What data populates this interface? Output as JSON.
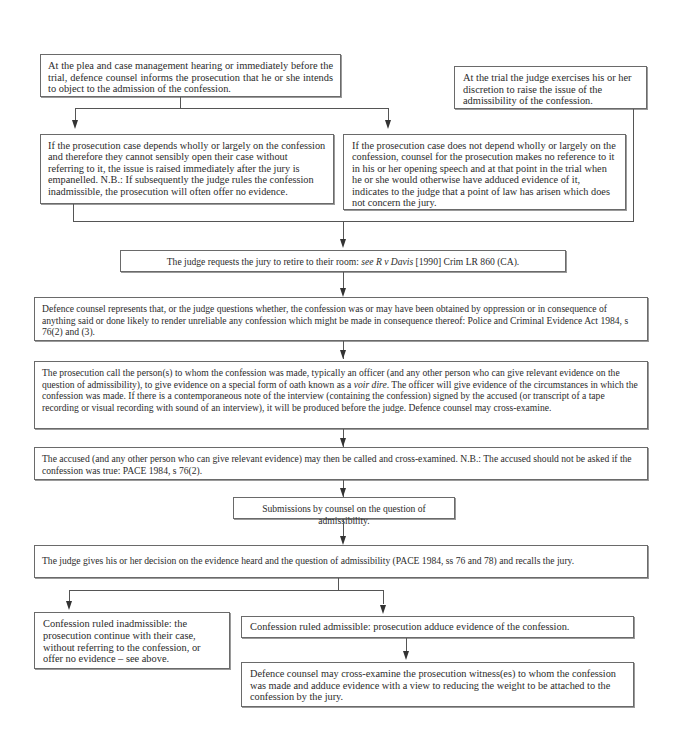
{
  "diagram": {
    "type": "flowchart",
    "nodes": {
      "plea_hearing": "At the plea and case management hearing or immediately before the trial, defence counsel informs the prosecution that he or she intends to object to the admission of the confession.",
      "judge_discretion": "At the trial the judge exercises his or her discretion to raise the issue of the admissibility of the confession.",
      "depends_wholly": "If the prosecution case depends wholly or largely on the confession and therefore they cannot sensibly open their case without referring to it, the issue is raised immediately after the jury is empanelled. N.B.: If subsequently the judge rules the confession inadmissible, the prosecution will often offer no evidence.",
      "not_depend": "If the prosecution case does not depend wholly or largely on the confession, counsel for the prosecution makes no reference to it in his or her opening speech and at that point in the trial when he or she would otherwise have adduced evidence of it, indicates to the judge that a point of law has arisen which does not concern the jury.",
      "jury_retire": {
        "before": "The judge requests the jury to retire to their room: ",
        "see": "see",
        "case": "R v Davis",
        "after": " [1990] Crim LR 860 (CA)."
      },
      "defence_represents": "Defence counsel represents that, or the judge questions whether, the confession was or may have been obtained by oppression or in consequence of anything said or done likely to render unreliable any confession which might be made in consequence thereof: Police and Criminal Evidence Act 1984, s 76(2) and (3).",
      "voir_dire": {
        "before": "The prosecution call the person(s) to whom the confession was made, typically an officer (and any other person who can give relevant evidence on the question of admissibility), to give evidence on a special form of oath known as a ",
        "term": "voir dire",
        "after": ". The officer will give evidence of the circumstances in which the confession was made. If there is a contemporaneous note of the interview (containing the confession) signed by the accused (or transcript of a tape recording or visual recording with sound of an interview), it will be produced before the judge. Defence counsel may cross-examine."
      },
      "accused_called": "The accused (and any other person who can give relevant evidence) may then be called and cross-examined. N.B.: The accused should not be asked if the confession was true: PACE 1984, s 76(2).",
      "submissions": "Submissions by counsel on the question of admissibility.",
      "judge_decision": "The judge gives his or her decision on the evidence heard and the question of admissibility (PACE 1984, ss 76 and 78) and recalls the jury.",
      "inadmissible": "Confession ruled inadmissible: the prosecution continue with their case, without referring to the confession, or offer no evidence – see above.",
      "admissible": "Confession ruled admissible: prosecution adduce evidence of the confession.",
      "cross_examine": "Defence counsel may cross-examine the prosecution witness(es) to whom the confession was made and adduce evidence with a view to reducing the weight to be attached to the confession by the jury."
    },
    "edges": [
      [
        "plea_hearing",
        "depends_wholly"
      ],
      [
        "plea_hearing",
        "not_depend"
      ],
      [
        "depends_wholly",
        "jury_retire"
      ],
      [
        "not_depend",
        "jury_retire"
      ],
      [
        "judge_discretion",
        "jury_retire"
      ],
      [
        "jury_retire",
        "defence_represents"
      ],
      [
        "defence_represents",
        "voir_dire"
      ],
      [
        "voir_dire",
        "accused_called"
      ],
      [
        "accused_called",
        "submissions"
      ],
      [
        "submissions",
        "judge_decision"
      ],
      [
        "judge_decision",
        "inadmissible"
      ],
      [
        "judge_decision",
        "admissible"
      ],
      [
        "admissible",
        "cross_examine"
      ]
    ]
  }
}
